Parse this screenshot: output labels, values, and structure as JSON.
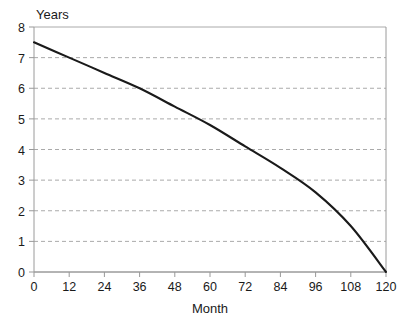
{
  "chart_data": {
    "type": "line",
    "title": "",
    "xlabel": "Month",
    "ylabel": "Years",
    "xlim": [
      0,
      120
    ],
    "ylim": [
      0,
      8
    ],
    "grid": true,
    "legend": false,
    "xticks": [
      0,
      12,
      24,
      36,
      48,
      60,
      72,
      84,
      96,
      108,
      120
    ],
    "yticks": [
      0,
      1,
      2,
      3,
      4,
      5,
      6,
      7,
      8
    ],
    "xtick_labels": [
      "0",
      "12",
      "24",
      "36",
      "48",
      "60",
      "72",
      "84",
      "96",
      "108",
      "120"
    ],
    "ytick_labels": [
      "0",
      "1",
      "2",
      "3",
      "4",
      "5",
      "6",
      "7",
      "8"
    ],
    "series": [
      {
        "name": "Remaining years",
        "x": [
          0,
          12,
          24,
          36,
          48,
          60,
          72,
          84,
          96,
          108,
          120
        ],
        "values": [
          7.5,
          7.0,
          6.5,
          6.0,
          5.4,
          4.8,
          4.1,
          3.4,
          2.6,
          1.5,
          0.0
        ]
      }
    ],
    "colors": {
      "line": "#1a1a1a",
      "grid": "#aaaaaa",
      "axis": "#999999",
      "text": "#1a1a1a",
      "background": "#ffffff"
    }
  },
  "axis_labels": {
    "y_axis_title": "Years",
    "x_axis_title": "Month"
  }
}
